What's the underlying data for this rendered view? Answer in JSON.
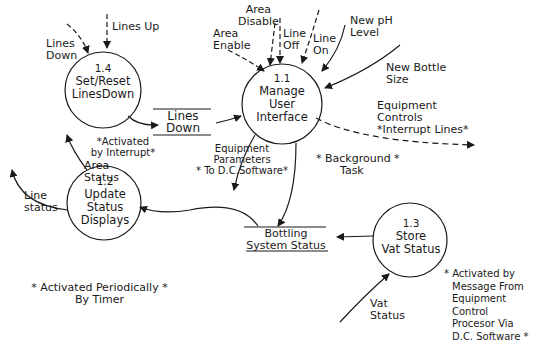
{
  "diagram": {
    "type": "data-flow-diagram",
    "processes": [
      {
        "id": "1.1",
        "name_line1": "Manage",
        "name_line2": "User",
        "name_line3": "Interface"
      },
      {
        "id": "1.2",
        "name_line1": "Update",
        "name_line2": "Status",
        "name_line3": "Displays"
      },
      {
        "id": "1.3",
        "name_line1": "Store",
        "name_line2": "Vat Status"
      },
      {
        "id": "1.4",
        "name_line1": "Set/Reset",
        "name_line2": "LinesDown"
      }
    ],
    "stores": [
      {
        "line1": "Lines",
        "line2": "Down"
      },
      {
        "line1": "Bottling",
        "line2": "System Status"
      }
    ],
    "flows": {
      "lines_down_in": {
        "line1": "Lines",
        "line2": "Down"
      },
      "lines_up": "Lines Up",
      "area_disable": {
        "line1": "Area",
        "line2": "Disable"
      },
      "area_enable": {
        "line1": "Area",
        "line2": "Enable"
      },
      "line_off": {
        "line1": "Line",
        "line2": "Off"
      },
      "line_on": {
        "line1": "Line",
        "line2": "On"
      },
      "new_ph_level": {
        "line1": "New pH",
        "line2": "Level"
      },
      "new_bottle_size": {
        "line1": "New Bottle",
        "line2": "Size"
      },
      "equipment_controls": {
        "line1": "Equipment",
        "line2": "Controls",
        "line3": "*Interrupt Lines*"
      },
      "equipment_parameters": {
        "line1": "Equipment",
        "line2": "Parameters",
        "line3": "* To D.C.Software*"
      },
      "area_status": {
        "line1": "Area",
        "line2": "Status"
      },
      "line_status": {
        "line1": "Line",
        "line2": "status"
      },
      "vat_status": {
        "line1": "Vat",
        "line2": "Status"
      }
    },
    "notes": {
      "interrupt": {
        "line1": "*Activated",
        "line2": "by Interrupt*"
      },
      "background": {
        "line1": "Background *",
        "line2": "Task",
        "prefix": "*"
      },
      "periodic": {
        "line1": "* Activated Periodically *",
        "line2": "By Timer"
      },
      "vat_note": {
        "line1": "* Activated by",
        "line2": "Message From",
        "line3": "Equipment",
        "line4": "Control",
        "line5": "Procesor Via",
        "line6": "D.C. Software *"
      }
    }
  }
}
